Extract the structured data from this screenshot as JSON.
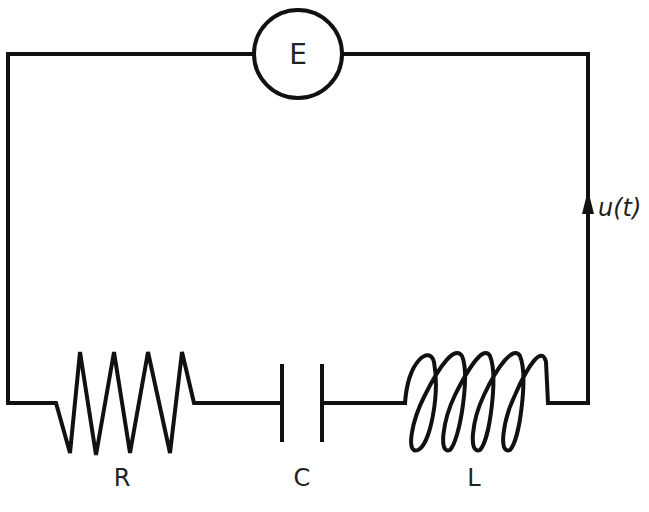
{
  "diagram": {
    "type": "series RLC circuit",
    "source": {
      "label": "E",
      "symbol": "circle"
    },
    "current": {
      "label": "u(t)",
      "direction": "up"
    },
    "components": [
      {
        "id": "resistor",
        "label": "R",
        "symbol": "zigzag"
      },
      {
        "id": "capacitor",
        "label": "C",
        "symbol": "parallel-plates"
      },
      {
        "id": "inductor",
        "label": "L",
        "symbol": "coil"
      }
    ],
    "colors": {
      "line": "#111111",
      "background": "#ffffff"
    }
  }
}
